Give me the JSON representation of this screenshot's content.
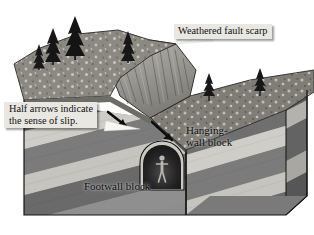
{
  "diagram": {
    "kind": "geologic-block-diagram",
    "width": 314,
    "height": 235,
    "background": "#ffffff"
  },
  "callouts": [
    {
      "id": "weathered-fault-scarp",
      "text": "Weathered fault scarp",
      "box_fill": "#e9e7e2",
      "text_color": "#101010",
      "leader": "white-tapered-wedge"
    },
    {
      "id": "half-arrows",
      "text": "Half arrows indicate\nthe sense of slip.",
      "box_fill": "#e9e7e2",
      "text_color": "#101010",
      "leader": "white-tapered-wedge"
    }
  ],
  "inline_labels": [
    {
      "id": "hanging-wall-block",
      "text": "Hanging-\nwall block",
      "text_color": "#0d0d0d"
    },
    {
      "id": "footwall-block",
      "text": "Footwall block",
      "text_color": "#0d0d0d"
    }
  ],
  "features": {
    "fault_plane": "dipping fault separating footwall (left/below) from hanging-wall (right)",
    "slip_arrows": 2,
    "tunnel": "arched mine adit with human figure for scale",
    "human_figure": "person silhouette, scale reference",
    "trees_upper_terrace": 4,
    "trees_lower_terrace": 2,
    "scarp": "eroded, gullied fault scarp face"
  },
  "palette": {
    "strata_dark": "#6f6f6f",
    "strata_mid": "#8d8d8d",
    "strata_light": "#cfcdc7",
    "strata_pale": "#b9b7b1",
    "ground_speckle": "#8a8880",
    "ground_dark": "#5e5c56",
    "scarp_face": "#a3a19a",
    "tunnel_dark": "#1f1f1f",
    "outline": "#151515",
    "callout_fill": "#e9e7e2"
  }
}
